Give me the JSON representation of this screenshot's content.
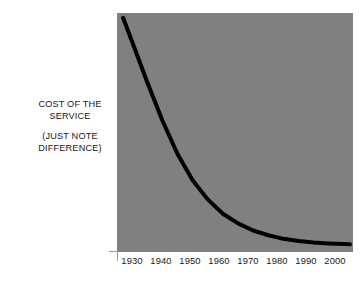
{
  "figure": {
    "background_color": "#ffffff",
    "plot_background_color": "#808080",
    "curve_color": "#000000",
    "text_color": "#1a1a1a",
    "axis_rule_color": "#9a9a9a"
  },
  "axis_label": {
    "line1": "COST OF THE",
    "line2": "SERVICE",
    "line3": "(JUST NOTE",
    "line4": "DIFFERENCE)"
  },
  "xaxis": {
    "ticks": [
      "1930",
      "1940",
      "1950",
      "1960",
      "1970",
      "1980",
      "1990",
      "2000"
    ]
  },
  "chart_data": {
    "type": "line",
    "title": "",
    "subtitle": "",
    "xlabel": "",
    "ylabel": "COST OF THE SERVICE (JUST NOTE DIFFERENCE)",
    "annotations": [
      "COST OF THE SERVICE",
      "(JUST NOTE DIFFERENCE)"
    ],
    "legend": [],
    "legend_position": "none",
    "grid": false,
    "xlim": [
      1925,
      2003
    ],
    "ylim": [
      0,
      100
    ],
    "xticks": [
      1930,
      1940,
      1950,
      1960,
      1970,
      1980,
      1990,
      2000
    ],
    "yticks": [],
    "ytick_labels": [],
    "series": [
      {
        "name": "Cost of the service",
        "color": "#000000",
        "line_width": 4,
        "x": [
          1927,
          1930,
          1935,
          1940,
          1945,
          1950,
          1955,
          1960,
          1965,
          1970,
          1975,
          1980,
          1985,
          1990,
          1995,
          2000,
          2002
        ],
        "values": [
          98,
          88,
          71,
          55,
          41,
          30,
          22,
          16,
          12,
          9,
          7,
          5.5,
          4.6,
          4.0,
          3.6,
          3.3,
          3.2
        ]
      }
    ]
  }
}
